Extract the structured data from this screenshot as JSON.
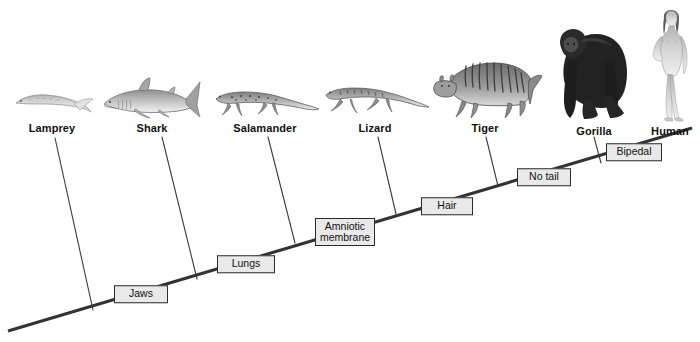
{
  "diagram": {
    "type": "cladogram",
    "background_color": "#ffffff",
    "line_color": "#3a3a3a",
    "backbone_color": "#333333",
    "box_fill": "#e9e9e9",
    "box_border": "#2b2b2b",
    "taxa": [
      {
        "name": "Lamprey",
        "label": "Lamprey",
        "x": 52,
        "label_y": 122,
        "tip_x": 55,
        "tip_y": 138,
        "base_x": 93,
        "base_y": 310
      },
      {
        "name": "Shark",
        "label": "Shark",
        "x": 152,
        "label_y": 122,
        "tip_x": 162,
        "tip_y": 137,
        "base_x": 197,
        "base_y": 279
      },
      {
        "name": "Salamander",
        "label": "Salamander",
        "x": 265,
        "label_y": 122,
        "tip_x": 268,
        "tip_y": 137,
        "base_x": 295,
        "base_y": 243
      },
      {
        "name": "Lizard",
        "label": "Lizard",
        "x": 375,
        "label_y": 122,
        "tip_x": 378,
        "tip_y": 137,
        "base_x": 396,
        "base_y": 214
      },
      {
        "name": "Tiger",
        "label": "Tiger",
        "x": 485,
        "label_y": 122,
        "tip_x": 486,
        "tip_y": 137,
        "base_x": 498,
        "base_y": 186
      },
      {
        "name": "Gorilla",
        "label": "Gorilla",
        "x": 594,
        "label_y": 125,
        "tip_x": 594,
        "tip_y": 137,
        "base_x": 601,
        "base_y": 163
      },
      {
        "name": "Human",
        "label": "Human",
        "x": 670,
        "label_y": 125,
        "tip_x": 670,
        "tip_y": 137,
        "base_x": 670,
        "base_y": 137
      }
    ],
    "traits": [
      {
        "name": "jaws",
        "label": "Jaws",
        "x": 141,
        "y": 294,
        "width": 54,
        "lines": [
          "Jaws"
        ]
      },
      {
        "name": "lungs",
        "label": "Lungs",
        "x": 246,
        "y": 264,
        "width": 58,
        "lines": [
          "Lungs"
        ]
      },
      {
        "name": "amniotic-membrane",
        "label": "Amniotic membrane",
        "x": 345,
        "y": 232,
        "width": 60,
        "lines": [
          "Amniotic",
          "membrane"
        ]
      },
      {
        "name": "hair",
        "label": "Hair",
        "x": 447,
        "y": 206,
        "width": 52,
        "lines": [
          "Hair"
        ]
      },
      {
        "name": "no-tail",
        "label": "No tail",
        "x": 544,
        "y": 177,
        "width": 54,
        "lines": [
          "No tail"
        ]
      },
      {
        "name": "bipedal",
        "label": "Bipedal",
        "x": 634,
        "y": 152,
        "width": 56,
        "lines": [
          "Bipedal"
        ]
      }
    ],
    "backbone": {
      "start": {
        "x": 8,
        "y": 331
      },
      "end": {
        "x": 692,
        "y": 128
      }
    }
  }
}
